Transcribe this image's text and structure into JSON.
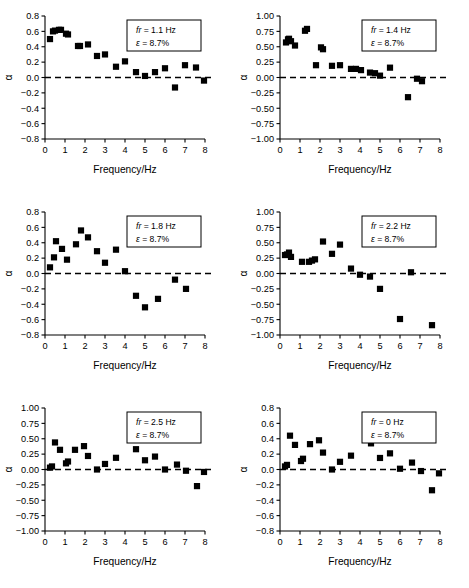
{
  "figure": {
    "axis_x_label": "Frequency/Hz",
    "axis_y_label": "α",
    "xlim": [
      0,
      8
    ],
    "xticks": [
      "0",
      "1",
      "2",
      "3",
      "4",
      "5",
      "6",
      "7",
      "8"
    ],
    "marker_color": "#000000",
    "zero_line_color": "#000000",
    "axis_color": "#000000",
    "annotation_box_border": "#000000"
  },
  "chart_data": [
    {
      "type": "scatter",
      "panel": 1,
      "title": "",
      "xlabel": "Frequency/Hz",
      "ylabel": "α",
      "xlim": [
        0,
        8
      ],
      "ylim": [
        -0.8,
        0.8
      ],
      "yticks": [
        0.8,
        0.6,
        0.4,
        0.2,
        0.0,
        -0.2,
        -0.4,
        -0.6,
        -0.8
      ],
      "ytick_labels": [
        "0.8",
        "0.6",
        "0.4",
        "0.2",
        "0.0",
        "-0.2",
        "-0.4",
        "-0.6",
        "-0.8"
      ],
      "xticks": [
        0,
        1,
        2,
        3,
        4,
        5,
        6,
        7,
        8
      ],
      "grid": false,
      "zero_line": true,
      "annotation": {
        "fr_symbol": "fr",
        "fr_text": " = 1.1 Hz",
        "eps_symbol": "ε",
        "eps_text": " = 8.7%"
      },
      "x": [
        0.25,
        0.4,
        0.5,
        0.7,
        0.8,
        1.05,
        1.15,
        1.65,
        1.75,
        2.15,
        2.6,
        3.0,
        3.55,
        4.0,
        4.55,
        5.0,
        5.5,
        6.0,
        6.5,
        7.0,
        7.55,
        7.95
      ],
      "y": [
        0.5,
        0.6,
        0.61,
        0.62,
        0.62,
        0.57,
        0.56,
        0.41,
        0.41,
        0.43,
        0.28,
        0.3,
        0.14,
        0.21,
        0.07,
        0.02,
        0.07,
        0.12,
        -0.13,
        0.16,
        0.13,
        -0.04
      ]
    },
    {
      "type": "scatter",
      "panel": 2,
      "title": "",
      "xlabel": "Frequency/Hz",
      "ylabel": "α",
      "xlim": [
        0,
        8
      ],
      "ylim": [
        -1.0,
        1.0
      ],
      "yticks": [
        1.0,
        0.75,
        0.5,
        0.25,
        0.0,
        -0.25,
        -0.5,
        -0.75,
        -1.0
      ],
      "ytick_labels": [
        "1.00",
        "0.75",
        "0.50",
        "0.25",
        "0.00",
        "-0.25",
        "-0.50",
        "-0.75",
        "-1.00"
      ],
      "xticks": [
        0,
        1,
        2,
        3,
        4,
        5,
        6,
        7,
        8
      ],
      "grid": false,
      "zero_line": true,
      "annotation": {
        "fr_symbol": "fr",
        "fr_text": " = 1.4 Hz",
        "eps_symbol": "ε",
        "eps_text": " = 8.7%"
      },
      "x": [
        0.3,
        0.4,
        0.45,
        0.55,
        0.75,
        1.25,
        1.35,
        1.8,
        2.05,
        2.15,
        2.6,
        3.0,
        3.55,
        3.8,
        4.05,
        4.5,
        4.75,
        5.0,
        5.5,
        6.4,
        6.85,
        7.1
      ],
      "y": [
        0.57,
        0.62,
        0.63,
        0.59,
        0.52,
        0.76,
        0.79,
        0.2,
        0.49,
        0.46,
        0.19,
        0.2,
        0.14,
        0.14,
        0.12,
        0.08,
        0.07,
        0.03,
        0.16,
        -0.32,
        -0.02,
        -0.06
      ]
    },
    {
      "type": "scatter",
      "panel": 3,
      "title": "",
      "xlabel": "Frequency/Hz",
      "ylabel": "α",
      "xlim": [
        0,
        8
      ],
      "ylim": [
        -0.8,
        0.8
      ],
      "yticks": [
        0.8,
        0.6,
        0.4,
        0.2,
        0.0,
        -0.2,
        -0.4,
        -0.6,
        -0.8
      ],
      "ytick_labels": [
        "0.8",
        "0.6",
        "0.4",
        "0.2",
        "0.0",
        "-0.2",
        "-0.4",
        "-0.6",
        "-0.8"
      ],
      "xticks": [
        0,
        1,
        2,
        3,
        4,
        5,
        6,
        7,
        8
      ],
      "grid": false,
      "zero_line": true,
      "annotation": {
        "fr_symbol": "fr",
        "fr_text": " = 1.8 Hz",
        "eps_symbol": "ε",
        "eps_text": " = 8.7%"
      },
      "x": [
        0.25,
        0.45,
        0.55,
        0.85,
        1.1,
        1.55,
        1.8,
        2.15,
        2.6,
        3.0,
        3.55,
        4.0,
        4.55,
        5.0,
        5.65,
        6.5,
        7.05
      ],
      "y": [
        0.08,
        0.21,
        0.42,
        0.32,
        0.18,
        0.38,
        0.56,
        0.47,
        0.29,
        0.14,
        0.31,
        0.03,
        -0.29,
        -0.44,
        -0.33,
        -0.08,
        -0.2
      ]
    },
    {
      "type": "scatter",
      "panel": 4,
      "title": "",
      "xlabel": "Frequency/Hz",
      "ylabel": "α",
      "xlim": [
        0,
        8
      ],
      "ylim": [
        -1.0,
        1.0
      ],
      "yticks": [
        1.0,
        0.75,
        0.5,
        0.25,
        0.0,
        -0.25,
        -0.5,
        -0.75,
        -1.0
      ],
      "ytick_labels": [
        "1.00",
        "0.75",
        "0.50",
        "0.25",
        "0.00",
        "-0.25",
        "-0.50",
        "-0.75",
        "-1.00"
      ],
      "xticks": [
        0,
        1,
        2,
        3,
        4,
        5,
        6,
        7,
        8
      ],
      "grid": false,
      "zero_line": true,
      "annotation": {
        "fr_symbol": "fr",
        "fr_text": " = 2.2 Hz",
        "eps_symbol": "ε",
        "eps_text": " = 8.7%"
      },
      "x": [
        0.25,
        0.35,
        0.45,
        0.55,
        1.1,
        1.45,
        1.6,
        1.75,
        2.15,
        2.6,
        3.0,
        3.55,
        4.0,
        4.5,
        5.0,
        6.0,
        6.55,
        7.6
      ],
      "y": [
        0.3,
        0.31,
        0.34,
        0.27,
        0.19,
        0.19,
        0.21,
        0.23,
        0.52,
        0.32,
        0.47,
        0.08,
        -0.02,
        -0.05,
        -0.25,
        -0.74,
        0.02,
        -0.84
      ]
    },
    {
      "type": "scatter",
      "panel": 5,
      "title": "",
      "xlabel": "Frequency/Hz",
      "ylabel": "α",
      "xlim": [
        0,
        8
      ],
      "ylim": [
        -1.0,
        1.0
      ],
      "yticks": [
        1.0,
        0.75,
        0.5,
        0.25,
        0.0,
        -0.25,
        -0.5,
        -0.75,
        -1.0
      ],
      "ytick_labels": [
        "1.00",
        "0.75",
        "0.50",
        "0.25",
        "0.00",
        "-0.25",
        "-0.50",
        "-0.75",
        "-1.00"
      ],
      "xticks": [
        0,
        1,
        2,
        3,
        4,
        5,
        6,
        7,
        8
      ],
      "grid": false,
      "zero_line": true,
      "annotation": {
        "fr_symbol": "fr",
        "fr_text": " = 2.5 Hz",
        "eps_symbol": "ε",
        "eps_text": " = 8.7%"
      },
      "x": [
        0.25,
        0.35,
        0.5,
        0.75,
        1.05,
        1.15,
        1.5,
        1.95,
        2.15,
        2.6,
        3.0,
        3.55,
        4.55,
        5.0,
        5.5,
        6.0,
        6.6,
        7.05,
        7.6,
        7.95
      ],
      "y": [
        0.03,
        0.05,
        0.44,
        0.32,
        0.1,
        0.13,
        0.32,
        0.38,
        0.22,
        0.0,
        0.09,
        0.19,
        0.33,
        0.15,
        0.21,
        0.0,
        0.08,
        -0.02,
        -0.27,
        -0.04
      ]
    },
    {
      "type": "scatter",
      "panel": 6,
      "title": "",
      "xlabel": "Frequency/Hz",
      "ylabel": "α",
      "xlim": [
        0,
        8
      ],
      "ylim": [
        -0.8,
        0.8
      ],
      "yticks": [
        0.8,
        0.6,
        0.4,
        0.2,
        0.0,
        -0.2,
        -0.4,
        -0.6,
        -0.8
      ],
      "ytick_labels": [
        "0.8",
        "0.6",
        "0.4",
        "0.2",
        "0.0",
        "-0.2",
        "-0.4",
        "-0.6",
        "-0.8"
      ],
      "xticks": [
        0,
        1,
        2,
        3,
        4,
        5,
        6,
        7,
        8
      ],
      "grid": false,
      "zero_line": true,
      "annotation": {
        "fr_symbol": "fr",
        "fr_text": " = 0 Hz",
        "eps_symbol": "ε",
        "eps_text": " = 8.7%"
      },
      "x": [
        0.25,
        0.35,
        0.5,
        0.75,
        1.05,
        1.15,
        1.5,
        1.95,
        2.15,
        2.6,
        3.0,
        3.55,
        4.55,
        5.0,
        5.5,
        6.0,
        6.6,
        7.05,
        7.6,
        7.95
      ],
      "y": [
        0.04,
        0.06,
        0.44,
        0.32,
        0.11,
        0.14,
        0.33,
        0.38,
        0.22,
        0.0,
        0.1,
        0.18,
        0.34,
        0.15,
        0.21,
        0.01,
        0.09,
        -0.02,
        -0.27,
        -0.05
      ]
    }
  ]
}
